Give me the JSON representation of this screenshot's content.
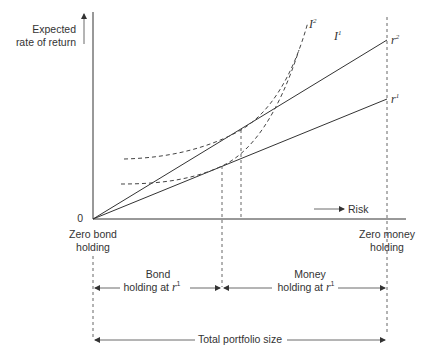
{
  "diagram": {
    "y_axis_label_line1": "Expected",
    "y_axis_label_line2": "rate of return",
    "origin_label": "0",
    "x_axis_label": "Risk",
    "lines": [
      {
        "name": "r",
        "sup": "2"
      },
      {
        "name": "r",
        "sup": "1"
      }
    ],
    "curves": [
      {
        "name": "I",
        "sup": "2"
      },
      {
        "name": "I",
        "sup": "1"
      }
    ],
    "left_label_line1": "Zero bond",
    "left_label_line2": "holding",
    "right_label_line1": "Zero money",
    "right_label_line2": "holding",
    "bond_label_line1": "Bond",
    "bond_label_line2": "holding at",
    "bond_label_var": "r",
    "bond_label_sup": "1",
    "money_label_line1": "Money",
    "money_label_line2": "holding at",
    "money_label_var": "r",
    "money_label_sup": "1",
    "total_label": "Total portfolio size"
  }
}
